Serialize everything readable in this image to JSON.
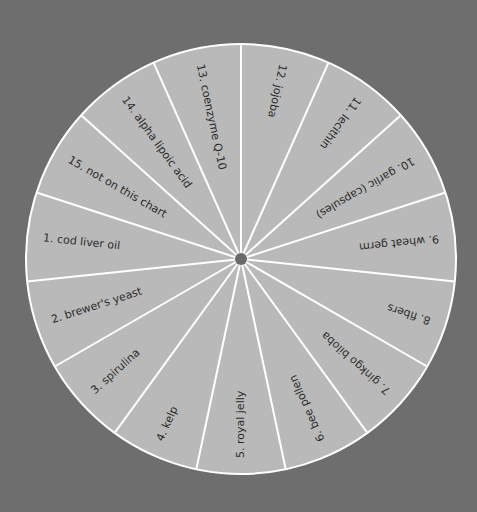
{
  "wheel": {
    "center": [
      241,
      259
    ],
    "radius": 215,
    "hub_radius": 6,
    "start_angle_deg": -90,
    "colors": {
      "background": "#6e6e6e",
      "wedge_fill": "#b9b9b9",
      "divider": "#ffffff",
      "label_text": "#2b2b2b",
      "hub": "#6a6a6a"
    },
    "segments_clockwise_from_top": [
      {
        "number": "12.",
        "label": "jojoba"
      },
      {
        "number": "11.",
        "label": "lecithin"
      },
      {
        "number": "10.",
        "label": "garlic (capsules)"
      },
      {
        "number": "9.",
        "label": "wheat germ"
      },
      {
        "number": "8.",
        "label": "fibers"
      },
      {
        "number": "7.",
        "label": "ginkgo biloba"
      },
      {
        "number": "6.",
        "label": "bee pollen"
      },
      {
        "number": "5.",
        "label": "royal jelly"
      },
      {
        "number": "4.",
        "label": "kelp"
      },
      {
        "number": "3.",
        "label": "spirulina"
      },
      {
        "number": "2.",
        "label": "brewer's yeast"
      },
      {
        "number": "1.",
        "label": "cod liver oil"
      },
      {
        "number": "15.",
        "label": "not on this chart"
      },
      {
        "number": "14.",
        "label": "alpha lipoic acid"
      },
      {
        "number": "13.",
        "label": "coenzyme Q-10"
      }
    ]
  }
}
